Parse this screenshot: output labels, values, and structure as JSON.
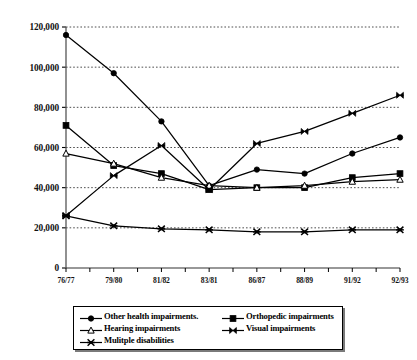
{
  "chart_data": {
    "type": "line",
    "title": "",
    "subtitle": "",
    "xlabel": "",
    "ylabel": "",
    "categories": [
      "76/77",
      "79/80",
      "81/82",
      "83/81",
      "86/87",
      "88/89",
      "91/92",
      "92/93"
    ],
    "xtick_labels": [
      "76/77",
      "79/80",
      "81/82",
      "83/81",
      "86/87",
      "88/89",
      "91/92",
      "92/93"
    ],
    "ytick_labels": [
      "0",
      "20,000",
      "40,000",
      "60,000",
      "80,000",
      "100,000",
      "120,000"
    ],
    "ytick_values": [
      0,
      20000,
      40000,
      60000,
      80000,
      100000,
      120000
    ],
    "ylim": [
      0,
      120000
    ],
    "grid": "horizontal-dashed",
    "legend_position": "bottom",
    "series": [
      {
        "name": "Other health impairments.",
        "marker": "filled-circle",
        "color": "#000000",
        "values": [
          116000,
          97000,
          73000,
          41000,
          49000,
          47000,
          57000,
          65000
        ]
      },
      {
        "name": "Orthopedic impairments",
        "marker": "filled-square",
        "color": "#000000",
        "values": [
          71000,
          51000,
          47000,
          39000,
          40000,
          40000,
          45000,
          47000
        ]
      },
      {
        "name": "Hearing impairments",
        "marker": "open-triangle",
        "color": "#000000",
        "values": [
          57000,
          52000,
          45000,
          41000,
          40000,
          41000,
          43000,
          44000
        ]
      },
      {
        "name": "Visual impairments",
        "marker": "bowtie-x",
        "color": "#000000",
        "values": [
          26000,
          46000,
          61000,
          39000,
          62000,
          68000,
          77000,
          86000
        ]
      },
      {
        "name": "Mulitple disabilities",
        "marker": "star-x",
        "color": "#000000",
        "values": [
          26000,
          21000,
          19500,
          19000,
          18000,
          18000,
          19000,
          19000
        ]
      }
    ]
  },
  "legend": {
    "items": [
      {
        "label": "Other health impairments.",
        "marker": "filled-circle"
      },
      {
        "label": "Orthopedic impairments",
        "marker": "filled-square"
      },
      {
        "label": "Hearing impairments",
        "marker": "open-triangle"
      },
      {
        "label": "Visual impairments",
        "marker": "bowtie-x"
      },
      {
        "label": "Mulitple disabilities",
        "marker": "star-x"
      }
    ]
  }
}
